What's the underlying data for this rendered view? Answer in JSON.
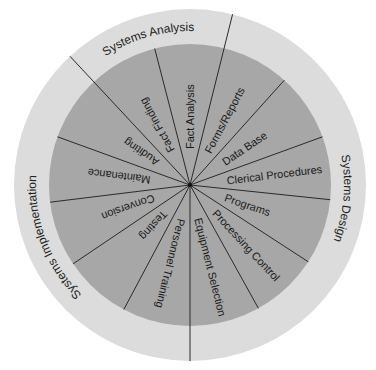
{
  "diagram": {
    "type": "circular-lifecycle-wheel",
    "colors": {
      "outer_ring": "#dcdcdc",
      "inner_disc": "#a7a7a7",
      "lines": "#2a2a2a",
      "text": "#1a1a1a"
    },
    "phases": [
      {
        "label": "Systems Analysis",
        "activities": [
          "Fact Finding",
          "Fact Analysis"
        ]
      },
      {
        "label": "Systems Design",
        "activities": [
          "Forms/Reports",
          "Data Base",
          "Clerical Procedures",
          "Programs",
          "Processing Control",
          "Equipment Selection"
        ]
      },
      {
        "label": "Systems Implementation",
        "activities": [
          "Personnel Training",
          "Testing",
          "Conversion",
          "Maintenance",
          "Auditing"
        ]
      }
    ],
    "wedges": [
      {
        "label": "Fact Analysis"
      },
      {
        "label": "Forms/Reports"
      },
      {
        "label": "Data Base"
      },
      {
        "label": "Clerical Procedures"
      },
      {
        "label": "Programs"
      },
      {
        "label": "Processing Control"
      },
      {
        "label": "Equipment Selection"
      },
      {
        "label": "Personnel Training"
      },
      {
        "label": "Testing"
      },
      {
        "label": "Conversion"
      },
      {
        "label": "Maintenance"
      },
      {
        "label": "Auditing"
      },
      {
        "label": "Fact Finding"
      }
    ]
  }
}
